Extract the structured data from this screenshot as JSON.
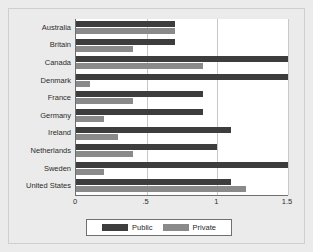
{
  "chart_data": {
    "type": "bar",
    "orientation": "horizontal",
    "title": "",
    "subtitle": "",
    "xlabel": "",
    "ylabel": "",
    "xlim": [
      0,
      1.5
    ],
    "grid": true,
    "grid_axis": "x",
    "legend_position": "bottom-center",
    "xticks": [
      0,
      0.5,
      1,
      1.5
    ],
    "xticklabels": [
      "0",
      ".5",
      "1",
      "1.5"
    ],
    "categories": [
      "Australia",
      "Britain",
      "Canada",
      "Denmark",
      "France",
      "Germany",
      "Ireland",
      "Netherlands",
      "Sweden",
      "United States"
    ],
    "series": [
      {
        "name": "Public",
        "color": "#3d3d3d",
        "values": [
          0.7,
          0.7,
          1.5,
          1.5,
          0.9,
          0.9,
          1.1,
          1.0,
          1.5,
          1.1
        ]
      },
      {
        "name": "Private",
        "color": "#8a8a8a",
        "values": [
          0.7,
          0.4,
          0.9,
          0.1,
          0.4,
          0.2,
          0.3,
          0.4,
          0.2,
          1.2
        ]
      }
    ]
  },
  "legend": {
    "entries": [
      {
        "label": "Public",
        "color": "#3d3d3d"
      },
      {
        "label": "Private",
        "color": "#8a8a8a"
      }
    ]
  },
  "colors": {
    "background": "#ebebeb",
    "plot_background": "#ffffff",
    "axis": "#6e6e6e",
    "gridline": "#c8c8c8",
    "public": "#3d3d3d",
    "private": "#8a8a8a",
    "text": "#2b2b2b"
  },
  "artifacts": {
    "speck": "+"
  }
}
